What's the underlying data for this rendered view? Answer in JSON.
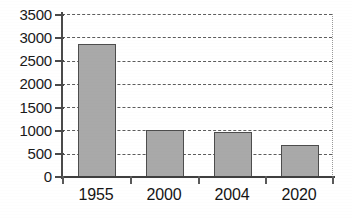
{
  "chart_data": {
    "type": "bar",
    "title": "",
    "subtitle": "",
    "xlabel": "",
    "ylabel": "",
    "categories": [
      "1955",
      "2000",
      "2004",
      "2020"
    ],
    "values": [
      2855,
      1000,
      960,
      687
    ],
    "series": [
      {
        "name": "",
        "values": [
          2855,
          1000,
          960,
          687
        ]
      }
    ],
    "ylim": [
      0,
      3500
    ],
    "ytick_step": 500,
    "ytick_labels": [
      "3500",
      "3000",
      "2500",
      "2000",
      "1500",
      "1000",
      "500",
      "0"
    ],
    "ytick_values": [
      3500,
      3000,
      2500,
      2000,
      1500,
      1000,
      500,
      0
    ],
    "xtick_labels": [
      "1955",
      "2000",
      "2004",
      "2020"
    ],
    "grid": "horizontal-dashed",
    "legend": "none",
    "legend_position": "none",
    "annotations": []
  },
  "style": {
    "bar_fill": "#a9a9a9",
    "bar_border": "#4d4d4d",
    "gridline_color": "#5d5d5d",
    "axis_color": "#4a4a4a",
    "text_color": "#151515",
    "background": "#ffffff",
    "plot_border_right": "#9a9a9a"
  }
}
